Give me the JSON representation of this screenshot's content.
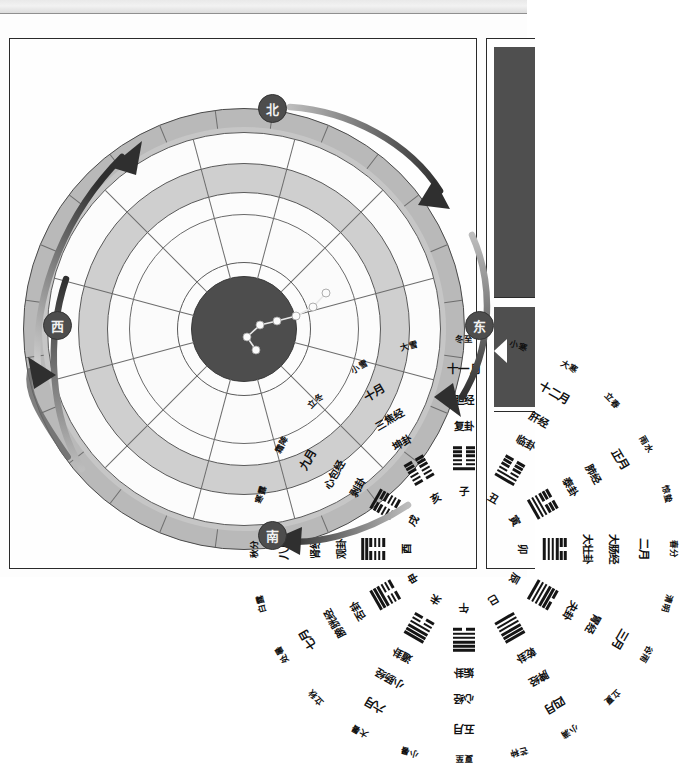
{
  "page": {
    "background_color": "#ffffff",
    "frame_border_color": "#2a2a2a"
  },
  "directions": [
    {
      "name": "north",
      "label": "北",
      "position": "top"
    },
    {
      "name": "east",
      "label": "东",
      "position": "right"
    },
    {
      "name": "south",
      "label": "南",
      "position": "bottom"
    },
    {
      "name": "west",
      "label": "西",
      "position": "left"
    }
  ],
  "rings": {
    "solar_terms": {
      "ring_name": "二十四节气",
      "count": 24,
      "fill_color": "#b9b9b9",
      "labels": [
        "冬至",
        "小寒",
        "大寒",
        "立春",
        "雨水",
        "惊蛰",
        "春分",
        "清明",
        "谷雨",
        "立夏",
        "小满",
        "芒种",
        "夏至",
        "小暑",
        "大暑",
        "立秋",
        "处暑",
        "白露",
        "秋分",
        "寒露",
        "霜降",
        "立冬",
        "小雪",
        "大雪"
      ]
    },
    "months": {
      "ring_name": "十二月",
      "count": 12,
      "fill_color": "#fcfcfc",
      "labels": [
        "十一月",
        "十二月",
        "正月",
        "二月",
        "三月",
        "四月",
        "五月",
        "六月",
        "七月",
        "八月",
        "九月",
        "十月"
      ]
    },
    "meridians": {
      "ring_name": "十二经络",
      "count": 12,
      "fill_color": "#cfcfcf",
      "labels": [
        "胆经",
        "肝经",
        "肺经",
        "大肠经",
        "胃经",
        "脾经",
        "心经",
        "小肠经",
        "膀胱经",
        "肾经",
        "心包经",
        "三焦经"
      ]
    },
    "hexagram_names": {
      "ring_name": "十二消息卦",
      "count": 12,
      "fill_color": "#fcfcfc",
      "labels": [
        "复卦",
        "临卦",
        "泰卦",
        "大壮卦",
        "夬卦",
        "乾卦",
        "姤卦",
        "遁卦",
        "否卦",
        "观卦",
        "剥卦",
        "坤卦"
      ]
    },
    "hexagram_figures": {
      "ring_name": "卦象",
      "count": 12,
      "note": "1 = 阳爻 solid, 0 = 阴爻 broken; listed bottom line first",
      "figures": [
        {
          "name": "复卦",
          "lines": [
            1,
            0,
            0,
            0,
            0,
            0
          ]
        },
        {
          "name": "临卦",
          "lines": [
            1,
            1,
            0,
            0,
            0,
            0
          ]
        },
        {
          "name": "泰卦",
          "lines": [
            1,
            1,
            1,
            0,
            0,
            0
          ]
        },
        {
          "name": "大壮卦",
          "lines": [
            1,
            1,
            1,
            1,
            0,
            0
          ]
        },
        {
          "name": "夬卦",
          "lines": [
            1,
            1,
            1,
            1,
            1,
            0
          ]
        },
        {
          "name": "乾卦",
          "lines": [
            1,
            1,
            1,
            1,
            1,
            1
          ]
        },
        {
          "name": "姤卦",
          "lines": [
            0,
            1,
            1,
            1,
            1,
            1
          ]
        },
        {
          "name": "遁卦",
          "lines": [
            0,
            0,
            1,
            1,
            1,
            1
          ]
        },
        {
          "name": "否卦",
          "lines": [
            0,
            0,
            0,
            1,
            1,
            1
          ]
        },
        {
          "name": "观卦",
          "lines": [
            0,
            0,
            0,
            0,
            1,
            1
          ]
        },
        {
          "name": "剥卦",
          "lines": [
            0,
            0,
            0,
            0,
            0,
            1
          ]
        },
        {
          "name": "坤卦",
          "lines": [
            0,
            0,
            0,
            0,
            0,
            0
          ]
        }
      ]
    },
    "earthly_branches": {
      "ring_name": "十二地支",
      "count": 12,
      "fill_color": "#fcfcfc",
      "labels": [
        "子",
        "丑",
        "寅",
        "卯",
        "辰",
        "巳",
        "午",
        "未",
        "申",
        "酉",
        "戌",
        "亥"
      ]
    }
  },
  "center": {
    "name": "北斗七星",
    "fill_color": "#4d4d4d",
    "star_count": 7,
    "stars": [
      {
        "x": 302,
        "y": 184
      },
      {
        "x": 289,
        "y": 198
      },
      {
        "x": 272,
        "y": 207
      },
      {
        "x": 253,
        "y": 212
      },
      {
        "x": 236,
        "y": 216
      },
      {
        "x": 223,
        "y": 228
      },
      {
        "x": 232,
        "y": 241
      }
    ]
  },
  "arrows": {
    "count": 4,
    "color": "#3a3a3a",
    "description": "四条弧形箭头 指示圆周方向"
  }
}
